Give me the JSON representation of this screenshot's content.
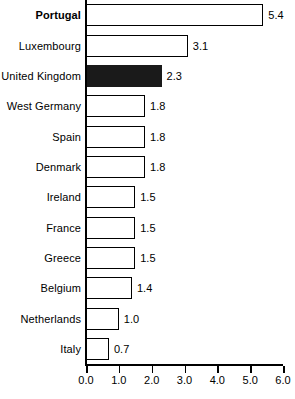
{
  "chart_data": {
    "type": "bar",
    "orientation": "horizontal",
    "title": "",
    "subtitle": "",
    "xlabel": "",
    "ylabel": "",
    "xlim": [
      0.0,
      6.0
    ],
    "xticks": [
      "0.0",
      "1.0",
      "2.0",
      "3.0",
      "4.0",
      "5.0",
      "6.0"
    ],
    "grid": false,
    "legend": null,
    "highlight_color": "#1a1a1a",
    "bar_fill": "#ffffff",
    "bar_edge": "#000000",
    "categories": [
      "Portugal",
      "Luxembourg",
      "United Kingdom",
      "West Germany",
      "Spain",
      "Denmark",
      "Ireland",
      "France",
      "Greece",
      "Belgium",
      "Netherlands",
      "Italy"
    ],
    "values": [
      5.4,
      3.1,
      2.3,
      1.8,
      1.8,
      1.8,
      1.5,
      1.5,
      1.5,
      1.4,
      1.0,
      0.7
    ],
    "value_labels": [
      "5.4",
      "3.1",
      "2.3",
      "1.8",
      "1.8",
      "1.8",
      "1.5",
      "1.5",
      "1.5",
      "1.4",
      "1.0",
      "0.7"
    ],
    "bars": [
      {
        "label": "Portugal",
        "value": 5.4,
        "value_label": "5.4",
        "bold_label": true,
        "highlighted": false
      },
      {
        "label": "Luxembourg",
        "value": 3.1,
        "value_label": "3.1",
        "bold_label": false,
        "highlighted": false
      },
      {
        "label": "United Kingdom",
        "value": 2.3,
        "value_label": "2.3",
        "bold_label": false,
        "highlighted": true
      },
      {
        "label": "West Germany",
        "value": 1.8,
        "value_label": "1.8",
        "bold_label": false,
        "highlighted": false
      },
      {
        "label": "Spain",
        "value": 1.8,
        "value_label": "1.8",
        "bold_label": false,
        "highlighted": false
      },
      {
        "label": "Denmark",
        "value": 1.8,
        "value_label": "1.8",
        "bold_label": false,
        "highlighted": false
      },
      {
        "label": "Ireland",
        "value": 1.5,
        "value_label": "1.5",
        "bold_label": false,
        "highlighted": false
      },
      {
        "label": "France",
        "value": 1.5,
        "value_label": "1.5",
        "bold_label": false,
        "highlighted": false
      },
      {
        "label": "Greece",
        "value": 1.5,
        "value_label": "1.5",
        "bold_label": false,
        "highlighted": false
      },
      {
        "label": "Belgium",
        "value": 1.4,
        "value_label": "1.4",
        "bold_label": false,
        "highlighted": false
      },
      {
        "label": "Netherlands",
        "value": 1.0,
        "value_label": "1.0",
        "bold_label": false,
        "highlighted": false
      },
      {
        "label": "Italy",
        "value": 0.7,
        "value_label": "0.7",
        "bold_label": false,
        "highlighted": false
      }
    ]
  }
}
